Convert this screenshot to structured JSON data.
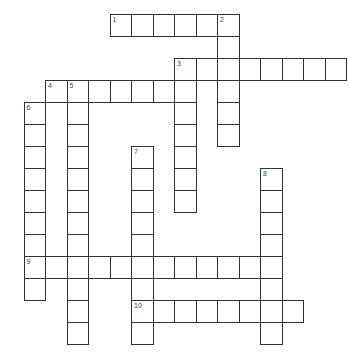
{
  "puzzle": {
    "origin": {
      "x": 23.5,
      "y": 14
    },
    "cell_w": 21.5,
    "cell_h": 22,
    "line_color": "#333333",
    "entries": [
      {
        "number": "1",
        "direction": "across",
        "col": 4,
        "row": 0,
        "length": 6
      },
      {
        "number": "2",
        "direction": "down",
        "col": 9,
        "row": 0,
        "length": 6
      },
      {
        "number": "3",
        "direction": "across",
        "col": 7,
        "row": 2,
        "length": 8
      },
      {
        "number": "3",
        "direction": "down",
        "col": 7,
        "row": 2,
        "length": 7
      },
      {
        "number": "4",
        "direction": "across",
        "col": 1,
        "row": 3,
        "length": 7
      },
      {
        "number": "5",
        "direction": "down",
        "col": 2,
        "row": 3,
        "length": 12
      },
      {
        "number": "6",
        "direction": "down",
        "col": 0,
        "row": 4,
        "length": 9
      },
      {
        "number": "7",
        "direction": "down",
        "col": 5,
        "row": 6,
        "length": 9
      },
      {
        "number": "8",
        "direction": "down",
        "col": 11,
        "row": 7,
        "length": 8
      },
      {
        "number": "9",
        "direction": "across",
        "col": 0,
        "row": 11,
        "length": 12
      },
      {
        "number": "10",
        "direction": "across",
        "col": 5,
        "row": 13,
        "length": 8
      }
    ]
  }
}
